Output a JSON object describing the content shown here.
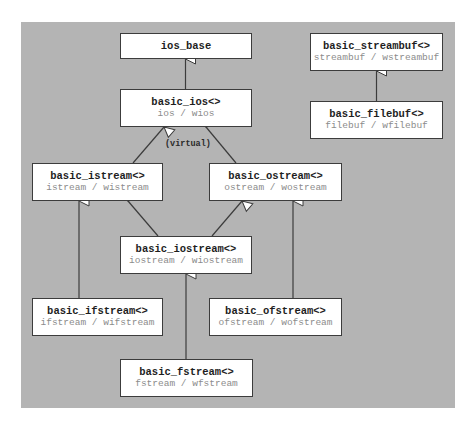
{
  "diagram": {
    "type": "class-inheritance",
    "background_color": "#b4b4b4",
    "nodes": [
      {
        "id": "ios_base",
        "name": "ios_base",
        "alias": ""
      },
      {
        "id": "basic_ios",
        "name": "basic_ios<>",
        "alias": "ios / wios"
      },
      {
        "id": "basic_streambuf",
        "name": "basic_streambuf<>",
        "alias": "streambuf / wstreambuf"
      },
      {
        "id": "basic_filebuf",
        "name": "basic_filebuf<>",
        "alias": "filebuf / wfilebuf"
      },
      {
        "id": "basic_istream",
        "name": "basic_istream<>",
        "alias": "istream / wistream"
      },
      {
        "id": "basic_ostream",
        "name": "basic_ostream<>",
        "alias": "ostream / wostream"
      },
      {
        "id": "basic_iostream",
        "name": "basic_iostream<>",
        "alias": "iostream / wiostream"
      },
      {
        "id": "basic_ifstream",
        "name": "basic_ifstream<>",
        "alias": "ifstream / wifstream"
      },
      {
        "id": "basic_ofstream",
        "name": "basic_ofstream<>",
        "alias": "ofstream / wofstream"
      },
      {
        "id": "basic_fstream",
        "name": "basic_fstream<>",
        "alias": "fstream / wfstream"
      }
    ],
    "edges": [
      {
        "from": "basic_ios",
        "to": "ios_base"
      },
      {
        "from": "basic_filebuf",
        "to": "basic_streambuf"
      },
      {
        "from": "basic_istream",
        "to": "basic_ios",
        "label": "(virtual)"
      },
      {
        "from": "basic_ostream",
        "to": "basic_ios"
      },
      {
        "from": "basic_iostream",
        "to": "basic_istream"
      },
      {
        "from": "basic_iostream",
        "to": "basic_ostream"
      },
      {
        "from": "basic_ifstream",
        "to": "basic_istream"
      },
      {
        "from": "basic_ofstream",
        "to": "basic_ostream"
      },
      {
        "from": "basic_fstream",
        "to": "basic_iostream"
      }
    ],
    "virtual_label": "(virtual)"
  }
}
